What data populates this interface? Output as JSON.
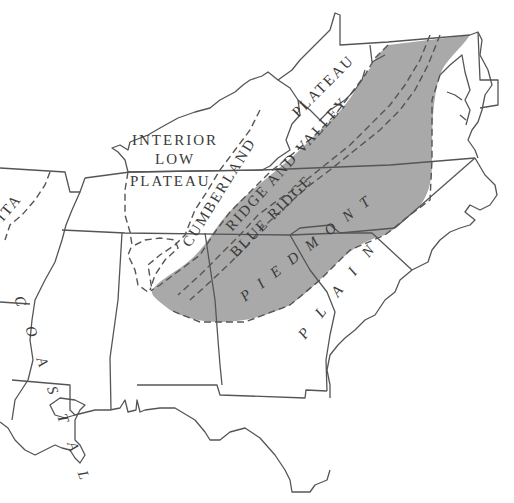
{
  "map": {
    "title": "Physiographic provinces of the southeastern United States",
    "colors": {
      "background": "#ffffff",
      "shaded_region": "#a9a9a9",
      "lines": "#555555",
      "label": "#3a3a3a"
    },
    "labels": {
      "interior_low_plateau_1": "INTERIOR",
      "interior_low_plateau_2": "LOW",
      "interior_low_plateau_3": "PLATEAU",
      "cumberland": "CUMBERLAND",
      "plateau": "PLATEAU",
      "ridge_and_valley": "RIDGE AND VALLEY",
      "blue_ridge": "BLUE RIDGE",
      "piedmont": "PIEDMONT",
      "coastal_plain_west": "COASTAL",
      "coastal_plain_east": "PLAIN",
      "ouachita_fragment": "ITA"
    },
    "legend": {
      "shaded": "Piedmont, Blue Ridge, Ridge and Valley (shaded)",
      "dashed_lines": "Physiographic province boundaries",
      "solid_lines": "State boundaries"
    }
  }
}
